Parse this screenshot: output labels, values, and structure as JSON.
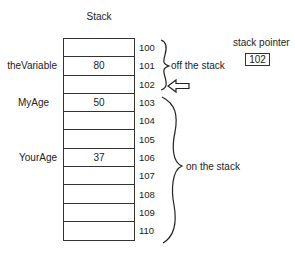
{
  "title": "Stack",
  "cells": [
    {
      "address": "100",
      "value": "",
      "label": ""
    },
    {
      "address": "101",
      "value": "80",
      "label": "theVariable"
    },
    {
      "address": "102",
      "value": "",
      "label": ""
    },
    {
      "address": "103",
      "value": "50",
      "label": "MyAge"
    },
    {
      "address": "104",
      "value": "",
      "label": ""
    },
    {
      "address": "105",
      "value": "",
      "label": ""
    },
    {
      "address": "106",
      "value": "37",
      "label": "YourAge"
    },
    {
      "address": "107",
      "value": "",
      "label": ""
    },
    {
      "address": "108",
      "value": "",
      "label": ""
    },
    {
      "address": "109",
      "value": "",
      "label": ""
    },
    {
      "address": "110",
      "value": "",
      "label": ""
    }
  ],
  "annotations": {
    "off_stack": "off the stack",
    "on_stack": "on the stack"
  },
  "stack_pointer": {
    "label": "stack pointer",
    "value": "102"
  },
  "icons": {
    "pointer_arrow": "hollow-left-arrow-icon",
    "braces": "curly-brace-icon"
  }
}
